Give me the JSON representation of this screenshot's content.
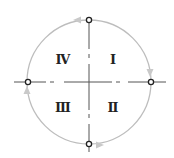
{
  "diagram": {
    "type": "quadrant-circle",
    "quadrants": [
      {
        "id": "I",
        "label": "Ⅰ",
        "position": "upper-right"
      },
      {
        "id": "II",
        "label": "Ⅱ",
        "position": "lower-right"
      },
      {
        "id": "III",
        "label": "Ⅲ",
        "position": "lower-left"
      },
      {
        "id": "IV",
        "label": "Ⅳ",
        "position": "upper-left"
      }
    ],
    "nodes": [
      "top",
      "right",
      "bottom",
      "left"
    ],
    "direction": "clockwise",
    "colors": {
      "circle": "#bfbfbf",
      "axis": "#444444",
      "arrow": "#c8c8c8",
      "text": "#222222"
    }
  }
}
